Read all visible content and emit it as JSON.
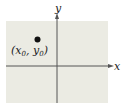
{
  "diagram": {
    "type": "coordinate-plane",
    "axes": {
      "x_label": "x",
      "y_label": "y"
    },
    "point": {
      "label_open": "(",
      "x_var": "x",
      "x_sub": "0",
      "sep": ", ",
      "y_var": "y",
      "y_sub": "0",
      "label_close": ")",
      "quadrant": "II"
    },
    "colors": {
      "panel": "#ebebe3",
      "axis": "#555555",
      "point": "#111111"
    }
  }
}
